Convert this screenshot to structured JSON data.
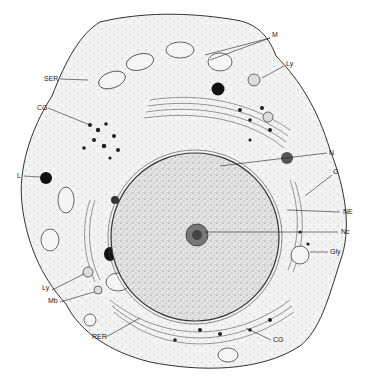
{
  "figure": {
    "colors": {
      "background": "#ffffff",
      "ink": "#222222",
      "nucleus_fill": "#cfcfcf",
      "cytoplasm_fill": "#ececec"
    }
  },
  "labels": [
    {
      "id": "M",
      "text": "M",
      "x": 272,
      "y": 35
    },
    {
      "id": "SER",
      "text": "SER",
      "x": 44,
      "y": 76
    },
    {
      "id": "Ly1",
      "text": "Ly",
      "x": 287,
      "y": 63
    },
    {
      "id": "CG1",
      "text": "CG",
      "x": 37,
      "y": 105
    },
    {
      "id": "N",
      "text": "N",
      "x": 329,
      "y": 150
    },
    {
      "id": "L",
      "text": "L",
      "x": 17,
      "y": 174
    },
    {
      "id": "G",
      "text": "G",
      "x": 333,
      "y": 170
    },
    {
      "id": "NE",
      "text": "NE",
      "x": 343,
      "y": 209
    },
    {
      "id": "Nc",
      "text": "Nc",
      "x": 341,
      "y": 229
    },
    {
      "id": "Gly",
      "text": "Gly",
      "x": 330,
      "y": 250
    },
    {
      "id": "Ly2",
      "text": "Ly",
      "x": 42,
      "y": 286
    },
    {
      "id": "Mb",
      "text": "Mb",
      "x": 48,
      "y": 299
    },
    {
      "id": "RER",
      "text": "RER",
      "x": 92,
      "y": 334
    },
    {
      "id": "CG2",
      "text": "CG",
      "x": 273,
      "y": 337
    }
  ]
}
